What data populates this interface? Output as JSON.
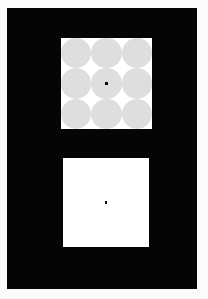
{
  "figure": {
    "background_color": "#050505",
    "page_color": "#fbfbfb",
    "width_px": 208,
    "height_px": 299
  },
  "panels": [
    {
      "id": "adapt-panel",
      "role": "adaptation-panel",
      "position": "top",
      "background_color": "#ffffff",
      "x": 61,
      "y": 38,
      "width": 91,
      "height": 91,
      "disc_grid": {
        "rows": 3,
        "columns": 3,
        "count": 9,
        "disc_color": "#dedede",
        "disc_diameter_px": 30.5,
        "gap_shape": "white-diamond"
      },
      "fixation": {
        "shape": "square-dot",
        "color": "#0b0b0b",
        "size_px": 2.4,
        "position": "center"
      }
    },
    {
      "id": "test-panel",
      "role": "test-panel",
      "position": "bottom",
      "background_color": "#ffffff",
      "x": 63,
      "y": 158,
      "width": 86,
      "height": 89,
      "disc_grid": null,
      "fixation": {
        "shape": "square-dot",
        "color": "#0b0b0b",
        "size_px": 2.4,
        "position": "center"
      }
    }
  ],
  "colors": {
    "surround": "#050505",
    "patch": "#ffffff",
    "disc": "#dedede",
    "fixation": "#0b0b0b"
  },
  "labels": {
    "none_visible": ""
  }
}
